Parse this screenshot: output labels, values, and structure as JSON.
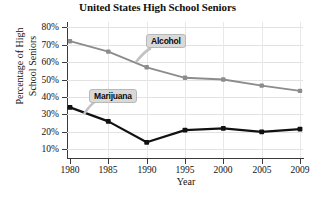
{
  "chart_data": {
    "type": "line",
    "title": "United States High School Seniors",
    "xlabel": "Year",
    "ylabel": "Percentage of High School Seniors",
    "ylabel_lines": [
      "Percentage of High",
      "School Seniors"
    ],
    "categories": [
      "1980",
      "1985",
      "1990",
      "1995",
      "2000",
      "2005",
      "2009"
    ],
    "xticks": [
      "1980",
      "1985",
      "1990",
      "1995",
      "2000",
      "2005",
      "2009"
    ],
    "yticks": [
      "10%",
      "20%",
      "30%",
      "40%",
      "50%",
      "60%",
      "70%",
      "80%"
    ],
    "ylim": [
      5,
      83
    ],
    "grid": true,
    "legend": "inline-callouts",
    "series": [
      {
        "name": "Alcohol",
        "color": "#8c8c8c",
        "values": [
          72,
          66,
          57,
          51,
          50,
          46.5,
          43.5
        ]
      },
      {
        "name": "Marijuana",
        "color": "#111111",
        "values": [
          34,
          26,
          14,
          21,
          22,
          20,
          21.5
        ]
      }
    ],
    "annotations": [
      {
        "label": "Alcohol",
        "points_to_series": "Alcohol"
      },
      {
        "label": "Marijuana",
        "points_to_series": "Marijuana"
      }
    ]
  }
}
